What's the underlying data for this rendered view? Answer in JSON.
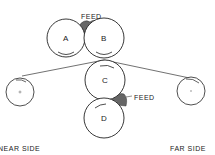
{
  "diagram": {
    "type": "roller mill schematic (hand-drawn)",
    "rollers": [
      {
        "id": "A",
        "label": "A"
      },
      {
        "id": "B",
        "label": "B"
      },
      {
        "id": "C",
        "label": "C"
      },
      {
        "id": "D",
        "label": "D"
      }
    ],
    "feed_labels": {
      "top": "FEED",
      "right": "FEED"
    },
    "side_labels": {
      "near": "NEAR SIDE",
      "far": "FAR SIDE"
    },
    "colors": {
      "ink": "#222222",
      "background": "#ffffff",
      "feed": "#555555"
    }
  }
}
